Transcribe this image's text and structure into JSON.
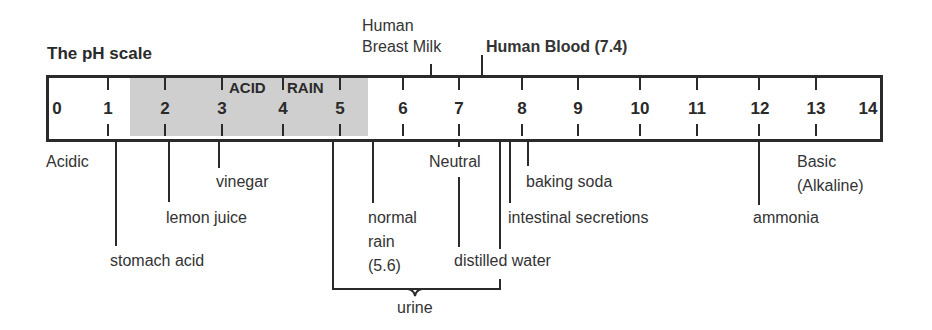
{
  "diagram": {
    "title": "The pH scale",
    "scale_numbers": [
      "0",
      "1",
      "2",
      "3",
      "4",
      "5",
      "6",
      "7",
      "8",
      "9",
      "10",
      "11",
      "12",
      "13",
      "14"
    ],
    "shaded_region_label_1": "ACID",
    "shaded_region_label_2": "RAIN",
    "shaded_region_color": "#cfcfcf",
    "end_labels": {
      "acidic": "Acidic",
      "neutral": "Neutral",
      "basic_line1": "Basic",
      "basic_line2": "(Alkaline)"
    },
    "above_markers": {
      "breast_milk_line1": "Human",
      "breast_milk_line2": "Breast Milk",
      "blood": "Human Blood (7.4)"
    },
    "below_markers": {
      "stomach_acid": "stomach acid",
      "lemon_juice": "lemon juice",
      "vinegar": "vinegar",
      "normal_rain_line1": "normal",
      "normal_rain_line2": "rain",
      "normal_rain_line3": "(5.6)",
      "distilled_water": "distilled water",
      "intestinal_secretions": "intestinal secretions",
      "baking_soda": "baking soda",
      "ammonia": "ammonia",
      "urine": "urine"
    }
  }
}
